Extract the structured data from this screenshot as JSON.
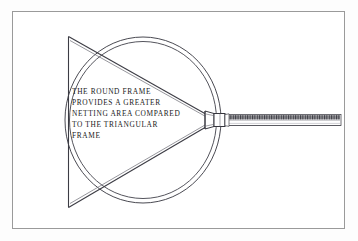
{
  "figure": {
    "border_color": "#9a9a9a",
    "background_color": "#ffffff",
    "ink_color": "#1a1a22",
    "line_color": "#44444c"
  },
  "caption": {
    "lines": [
      "THE ROUND FRAME",
      "PROVIDES  A GREATER",
      "NETTING AREA COMPARED",
      "TO THE TRIANGULAR",
      "FRAME"
    ],
    "full_text": "THE ROUND FRAME PROVIDES A GREATER NETTING AREA COMPARED TO THE TRIANGULAR FRAME"
  },
  "shapes": {
    "round_frame": {
      "label": "round-frame",
      "center_x": 143,
      "center_y": 120,
      "outer_radius_x": 78,
      "outer_radius_y": 83,
      "inner_radius_x": 73,
      "inner_radius_y": 78,
      "ring_count": 2
    },
    "triangular_frame": {
      "label": "triangular-frame",
      "apex_x": 212,
      "apex_y": 120,
      "top_left_x": 68,
      "top_left_y": 37,
      "bottom_left_x": 68,
      "bottom_left_y": 207
    },
    "handle": {
      "label": "handle-shaft",
      "start_x": 214,
      "end_x": 341,
      "center_y": 120,
      "thickness": 9,
      "collar_width": 10
    }
  }
}
